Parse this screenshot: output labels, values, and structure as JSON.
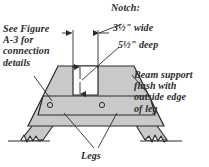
{
  "figure": {
    "background_color": "#ffffff",
    "ink_color": "#2b2b2b",
    "fill_color": "#c9c9c9",
    "annotations": {
      "connection_note": "See Figure\nA-3 for\nconnection\ndetails",
      "notch_title": "Notch:",
      "notch_width": "3½\" wide",
      "notch_depth": "5½\" deep",
      "beam_support_note": "Beam support\nflush with\noutside edge\nof leg",
      "legs_label": "Legs"
    },
    "parts": {
      "body_name": "trestle-body",
      "notch_name": "notch-cutout",
      "beam_name": "beam-support-band",
      "left_leg_name": "left-leg",
      "right_leg_name": "right-leg",
      "bolt_left_name": "bolt-left",
      "bolt_right_name": "bolt-right"
    },
    "dimensions": {
      "notch_width_value": "3½\"",
      "notch_depth_value": "5½\"",
      "notch_width_units": "inches",
      "notch_depth_units": "inches"
    }
  }
}
